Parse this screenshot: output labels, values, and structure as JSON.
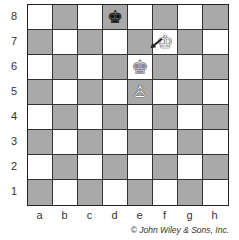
{
  "board": {
    "ranks": [
      "8",
      "7",
      "6",
      "5",
      "4",
      "3",
      "2",
      "1"
    ],
    "files": [
      "a",
      "b",
      "c",
      "d",
      "e",
      "f",
      "g",
      "h"
    ],
    "colors": {
      "light": "#ffffff",
      "dark": "#a9a9a9",
      "border": "#222222"
    },
    "pieces": [
      {
        "square": "d8",
        "type": "king",
        "color": "black",
        "glyph": "♚"
      },
      {
        "square": "f7",
        "type": "king",
        "color": "white",
        "glyph": "♔"
      },
      {
        "square": "e6",
        "type": "king",
        "color": "ghost",
        "glyph": "♚",
        "note": "previous position (faded)"
      },
      {
        "square": "e5",
        "type": "pawn",
        "color": "white",
        "glyph": "♙"
      }
    ],
    "arrow": {
      "from": "e6",
      "to": "f7"
    }
  },
  "copyright": "© John Wiley & Sons, Inc."
}
